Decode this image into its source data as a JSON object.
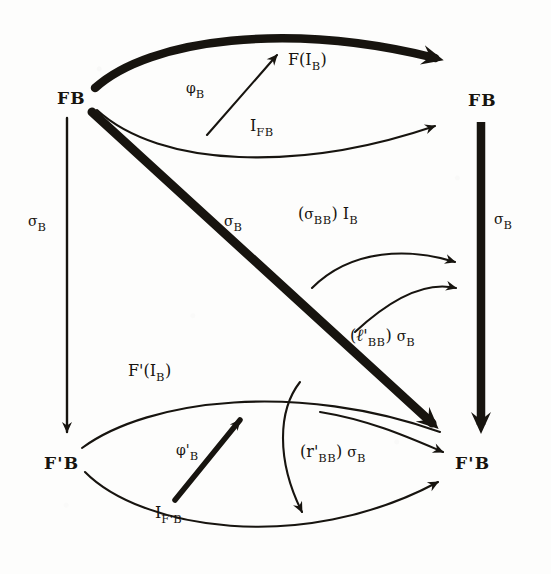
{
  "diagram": {
    "ink_color": "#17140f",
    "background_color": "#fdfdfc",
    "nodes": [
      {
        "id": "fb-top-left",
        "text": "FB",
        "x": 57,
        "y": 90
      },
      {
        "id": "fb-top-right",
        "text": "FB",
        "x": 468,
        "y": 92
      },
      {
        "id": "fprimeb-bot-left",
        "text": "F'B",
        "x": 44,
        "y": 455
      },
      {
        "id": "fprimeb-bot-right",
        "text": "F'B",
        "x": 455,
        "y": 455
      }
    ],
    "edge_labels": [
      {
        "id": "f-i-b",
        "base": "F(I",
        "sub": "B",
        "tail": ")",
        "x": 288,
        "y": 52,
        "weight": "thick"
      },
      {
        "id": "phi-b",
        "base": "φ",
        "sub": "B",
        "tail": "",
        "x": 186,
        "y": 80,
        "weight": "thin"
      },
      {
        "id": "i-fb",
        "base": "I",
        "sub": "FB",
        "tail": "",
        "x": 250,
        "y": 118,
        "weight": "thin"
      },
      {
        "id": "sigma-b-left",
        "base": "σ",
        "sub": "B",
        "tail": "",
        "x": 28,
        "y": 213,
        "weight": "thin"
      },
      {
        "id": "sigma-b-diag",
        "base": "σ",
        "sub": "B",
        "tail": "",
        "x": 224,
        "y": 213,
        "weight": "thick"
      },
      {
        "id": "sigma-b-right",
        "base": "σ",
        "sub": "B",
        "tail": "",
        "x": 494,
        "y": 211,
        "weight": "thick"
      },
      {
        "id": "sigma-bb-i-b",
        "text": "(σ_BB) I_B",
        "x": 298,
        "y": 206,
        "weight": "thin"
      },
      {
        "id": "ell-bb-sigma-b",
        "text": "(ℓ'_BB) σ_B",
        "x": 350,
        "y": 327,
        "weight": "thin"
      },
      {
        "id": "fprime-i-b",
        "base": "F'(I",
        "sub": "B",
        "tail": ")",
        "x": 128,
        "y": 363,
        "weight": "thin"
      },
      {
        "id": "phi-prime-b",
        "base": "φ'",
        "sub": "B",
        "tail": "",
        "x": 176,
        "y": 442,
        "weight": "thick"
      },
      {
        "id": "r-bb-sigma-b",
        "text": "(r'_BB) σ_B",
        "x": 300,
        "y": 444,
        "weight": "thin"
      },
      {
        "id": "i-fprime-b",
        "base": "I",
        "sub": "F'B",
        "tail": "",
        "x": 155,
        "y": 505,
        "weight": "thin"
      }
    ],
    "arrows": [
      {
        "id": "arrow-top-thick",
        "from": "fb-top-left",
        "to": "fb-top-right",
        "label": "f-i-b",
        "style": "thick-curve-up"
      },
      {
        "id": "arrow-top-thin",
        "from": "fb-top-left",
        "to": "fb-top-right",
        "label": "i-fb",
        "style": "thin-curve-down"
      },
      {
        "id": "arrow-phi-b",
        "from": "i-fb-curve",
        "to": "f-i-b-curve",
        "label": "phi-b",
        "style": "thin-straight"
      },
      {
        "id": "arrow-left-vertical",
        "from": "fb-top-left",
        "to": "fprimeb-bot-left",
        "label": "sigma-b-left",
        "style": "thin-straight"
      },
      {
        "id": "arrow-right-vertical",
        "from": "fb-top-right",
        "to": "fprimeb-bot-right",
        "label": "sigma-b-right",
        "style": "thick-straight"
      },
      {
        "id": "arrow-diagonal",
        "from": "fb-top-left",
        "to": "fprimeb-bot-right",
        "label": "sigma-b-diag",
        "style": "thick-straight"
      },
      {
        "id": "arrow-sigma-bb-i-b",
        "from": "mid-left",
        "to": "fprimeb-bot-right",
        "label": "sigma-bb-i-b",
        "style": "thin-curve"
      },
      {
        "id": "arrow-ell-bb-sigma-b",
        "from": "mid-left-lower",
        "to": "fprimeb-bot-right",
        "label": "ell-bb-sigma-b",
        "style": "thin-curve"
      },
      {
        "id": "arrow-bottom-thin-up",
        "from": "fprimeb-bot-left",
        "to": "fprimeb-bot-right",
        "label": "fprime-i-b",
        "style": "thin-curve-up"
      },
      {
        "id": "arrow-bottom-thin-down",
        "from": "fprimeb-bot-left",
        "to": "fprimeb-bot-right",
        "label": "i-fprime-b",
        "style": "thin-curve-down"
      },
      {
        "id": "arrow-phi-prime-b",
        "from": "i-fprime-b-curve",
        "to": "fprime-i-b-curve",
        "label": "phi-prime-b",
        "style": "thick-straight"
      },
      {
        "id": "arrow-r-bb-sigma-b",
        "from": "upper-mid",
        "to": "fprimeb-bot-right",
        "label": "r-bb-sigma-b",
        "style": "thin-curve"
      },
      {
        "id": "arrow-r-bb-hook",
        "from": "upper-mid",
        "to": "bottom-curve",
        "label": "",
        "style": "thin-curve-hook"
      }
    ]
  }
}
